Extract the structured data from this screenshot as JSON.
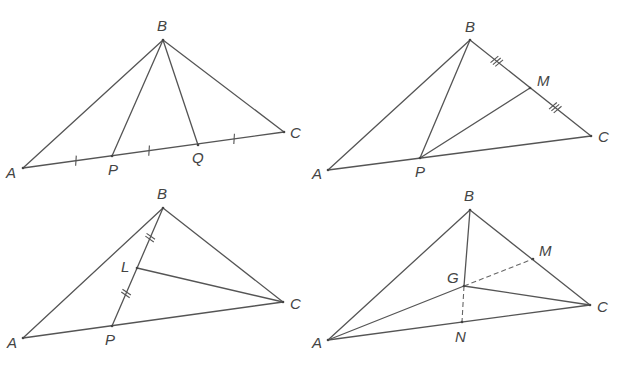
{
  "figures": [
    {
      "id": "fig1",
      "description": "Triangle ABC with AC trisected by P and Q",
      "points": {
        "A": {
          "x": 23,
          "y": 168,
          "label": "A",
          "lx": 6,
          "ly": 178
        },
        "B": {
          "x": 163,
          "y": 40,
          "label": "B",
          "lx": 157,
          "ly": 31
        },
        "C": {
          "x": 284,
          "y": 132,
          "label": "C",
          "lx": 290,
          "ly": 138
        },
        "P": {
          "x": 112,
          "y": 156,
          "label": "P",
          "lx": 108,
          "ly": 175
        },
        "Q": {
          "x": 198,
          "y": 145,
          "label": "Q",
          "lx": 192,
          "ly": 163
        }
      },
      "segments": [
        [
          "A",
          "B"
        ],
        [
          "B",
          "C"
        ],
        [
          "A",
          "C"
        ],
        [
          "B",
          "P"
        ],
        [
          "B",
          "Q"
        ]
      ],
      "ticks": [
        {
          "x": 76,
          "y": 161,
          "count": 1
        },
        {
          "x": 149,
          "y": 150,
          "count": 1
        },
        {
          "x": 234,
          "y": 138,
          "count": 1
        }
      ]
    },
    {
      "id": "fig2",
      "description": "Triangle ABC with M midpoint of BC and P on AC",
      "points": {
        "A": {
          "x": 328,
          "y": 170,
          "label": "A",
          "lx": 312,
          "ly": 179
        },
        "B": {
          "x": 470,
          "y": 40,
          "label": "B",
          "lx": 465,
          "ly": 32
        },
        "C": {
          "x": 591,
          "y": 136,
          "label": "C",
          "lx": 598,
          "ly": 142
        },
        "P": {
          "x": 420,
          "y": 158,
          "label": "P",
          "lx": 415,
          "ly": 177
        },
        "M": {
          "x": 530,
          "y": 88,
          "label": "M",
          "lx": 537,
          "ly": 86
        }
      },
      "segments": [
        [
          "A",
          "B"
        ],
        [
          "B",
          "C"
        ],
        [
          "A",
          "C"
        ],
        [
          "B",
          "P"
        ],
        [
          "P",
          "M"
        ]
      ],
      "ticks": [
        {
          "x": 497,
          "y": 61,
          "count": 3
        },
        {
          "x": 555,
          "y": 108,
          "count": 3
        }
      ]
    },
    {
      "id": "fig3",
      "description": "Triangle ABC with L midpoint of BP",
      "points": {
        "A": {
          "x": 23,
          "y": 338,
          "label": "A",
          "lx": 7,
          "ly": 348
        },
        "B": {
          "x": 163,
          "y": 208,
          "label": "B",
          "lx": 157,
          "ly": 199
        },
        "C": {
          "x": 283,
          "y": 302,
          "label": "C",
          "lx": 290,
          "ly": 309
        },
        "P": {
          "x": 112,
          "y": 326,
          "label": "P",
          "lx": 105,
          "ly": 345
        },
        "L": {
          "x": 137,
          "y": 268,
          "label": "L",
          "lx": 121,
          "ly": 272
        }
      },
      "segments": [
        [
          "A",
          "B"
        ],
        [
          "B",
          "C"
        ],
        [
          "A",
          "C"
        ],
        [
          "B",
          "P"
        ],
        [
          "L",
          "C"
        ]
      ],
      "ticks": [
        {
          "x": 151,
          "y": 238,
          "count": 2
        },
        {
          "x": 125,
          "y": 293,
          "count": 2
        }
      ]
    },
    {
      "id": "fig4",
      "description": "Triangle ABC with centroid G, medians to M and N dashed",
      "points": {
        "A": {
          "x": 328,
          "y": 340,
          "label": "A",
          "lx": 312,
          "ly": 348
        },
        "B": {
          "x": 470,
          "y": 210,
          "label": "B",
          "lx": 464,
          "ly": 201
        },
        "C": {
          "x": 590,
          "y": 305,
          "label": "C",
          "lx": 597,
          "ly": 312
        },
        "G": {
          "x": 464,
          "y": 286,
          "label": "G",
          "lx": 447,
          "ly": 283
        },
        "M": {
          "x": 533,
          "y": 259,
          "label": "M",
          "lx": 539,
          "ly": 256
        },
        "N": {
          "x": 462,
          "y": 322,
          "label": "N",
          "lx": 455,
          "ly": 342
        }
      },
      "segments": [
        [
          "A",
          "B"
        ],
        [
          "B",
          "C"
        ],
        [
          "A",
          "C"
        ],
        [
          "B",
          "G"
        ],
        [
          "A",
          "G"
        ],
        [
          "G",
          "C"
        ]
      ],
      "dashed": [
        [
          "G",
          "M"
        ],
        [
          "G",
          "N"
        ]
      ],
      "ticks": []
    }
  ],
  "colors": {
    "line": "#555555",
    "label": "#444444",
    "background": "#ffffff"
  }
}
